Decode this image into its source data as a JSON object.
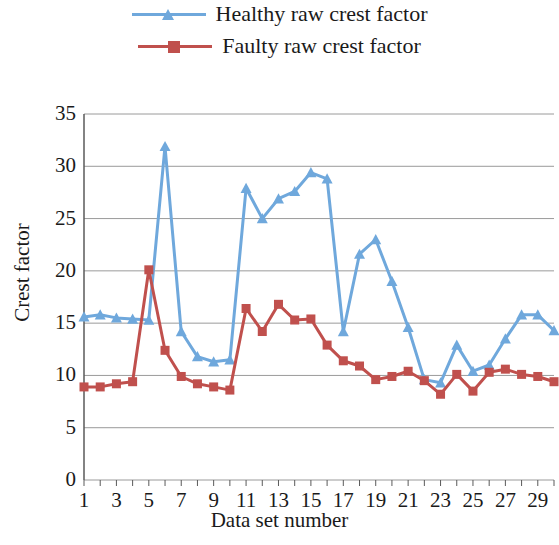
{
  "legend": {
    "items": [
      {
        "label": "Healthy raw crest factor",
        "color": "#6FA8DC",
        "marker": "triangle"
      },
      {
        "label": "Faulty raw crest factor",
        "color": "#C0504D",
        "marker": "square"
      }
    ]
  },
  "chart_data": {
    "type": "line",
    "title": "",
    "xlabel": "Data set number",
    "ylabel": "Crest factor",
    "x": [
      1,
      2,
      3,
      4,
      5,
      6,
      7,
      8,
      9,
      10,
      11,
      12,
      13,
      14,
      15,
      16,
      17,
      18,
      19,
      20,
      21,
      22,
      23,
      24,
      25,
      26,
      27,
      28,
      29,
      30
    ],
    "xlim": [
      1,
      30
    ],
    "ylim": [
      0,
      35
    ],
    "yticks": [
      0,
      5,
      10,
      15,
      20,
      25,
      30,
      35
    ],
    "xticks": [
      1,
      3,
      5,
      7,
      9,
      11,
      13,
      15,
      17,
      19,
      21,
      23,
      25,
      27,
      29
    ],
    "grid": true,
    "legend_position": "top",
    "series": [
      {
        "name": "Healthy raw crest factor",
        "color": "#6FA8DC",
        "marker": "triangle",
        "values": [
          15.6,
          15.8,
          15.5,
          15.4,
          15.3,
          31.9,
          14.2,
          11.8,
          11.3,
          11.5,
          27.9,
          25.0,
          26.9,
          27.6,
          29.4,
          28.8,
          14.2,
          21.6,
          23.0,
          19.0,
          14.6,
          9.6,
          9.3,
          12.9,
          10.4,
          11.0,
          13.5,
          15.8,
          15.8,
          14.3
        ]
      },
      {
        "name": "Faulty raw crest factor",
        "color": "#C0504D",
        "marker": "square",
        "values": [
          8.9,
          8.9,
          9.2,
          9.4,
          20.1,
          12.4,
          9.9,
          9.2,
          8.9,
          8.6,
          16.4,
          14.2,
          16.8,
          15.3,
          15.4,
          12.9,
          11.4,
          10.9,
          9.6,
          9.9,
          10.4,
          9.5,
          8.2,
          10.1,
          8.5,
          10.3,
          10.6,
          10.1,
          9.9,
          9.4
        ]
      }
    ]
  }
}
